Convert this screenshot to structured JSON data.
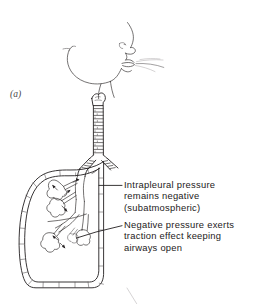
{
  "figure": {
    "panel_letter": "(a)",
    "domain_subject": "respiratory-system-illustration",
    "background_color": "#ffffff",
    "ink_color": "#231f20"
  },
  "annotations": [
    {
      "id": "intrapleural",
      "lines": [
        "Intrapleural pressure",
        "remains negative",
        "(subatmospheric)"
      ],
      "text": "Intrapleural pressure\nremains negative\n(subatmospheric)"
    },
    {
      "id": "negative-pressure",
      "lines": [
        "Negative pressure exerts",
        "traction effect keeping",
        "airways open"
      ],
      "text": "Negative pressure exerts\ntraction effect keeping\nairways open"
    }
  ],
  "anatomy": {
    "head_profile": "head-profile-outline",
    "nose": "nose-icon",
    "nostril": "nostril-icon",
    "lips": "lips-icon",
    "chin": "chin-outline",
    "jaw": "jaw-outline",
    "airflow": "airflow-lines-icon",
    "larynx": "larynx-icon",
    "trachea": "trachea-icon",
    "carina": "bronchial-bifurcation-icon",
    "bronchi": "main-bronchi-icon",
    "lung": "lung-outline-icon",
    "pleura": "pleural-membrane-icon",
    "alveoli": "alveolar-sac-icon",
    "traction_arrows": "traction-arrow-icon",
    "next_panel_hint": "panel-b-partial-line"
  }
}
